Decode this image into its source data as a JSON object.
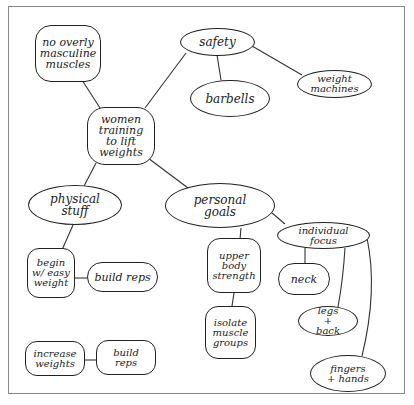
{
  "diagram": {
    "type": "mind-map",
    "style": "hand-drawn",
    "nodes": [
      {
        "id": "center",
        "label": "women training to lift weights"
      },
      {
        "id": "no-masc",
        "label": "no overly masculine muscles"
      },
      {
        "id": "safety",
        "label": "safety"
      },
      {
        "id": "barbells",
        "label": "barbells"
      },
      {
        "id": "weight-machines",
        "label": "weight machines"
      },
      {
        "id": "physical-stuff",
        "label": "physical stuff"
      },
      {
        "id": "begin-easy",
        "label": "begin w/ easy weight"
      },
      {
        "id": "build-reps-1",
        "label": "build reps"
      },
      {
        "id": "increase-weights",
        "label": "increase weights"
      },
      {
        "id": "build-reps-2",
        "label": "build reps"
      },
      {
        "id": "personal-goals",
        "label": "personal goals"
      },
      {
        "id": "upper-body",
        "label": "upper body strength"
      },
      {
        "id": "isolate",
        "label": "isolate muscle groups"
      },
      {
        "id": "individual-focus",
        "label": "individual focus"
      },
      {
        "id": "neck",
        "label": "neck"
      },
      {
        "id": "legs-back",
        "label": "legs + back"
      },
      {
        "id": "fingers-hands",
        "label": "fingers + hands"
      }
    ],
    "edges": [
      [
        "center",
        "no-masc"
      ],
      [
        "center",
        "safety"
      ],
      [
        "safety",
        "barbells"
      ],
      [
        "safety",
        "weight-machines"
      ],
      [
        "center",
        "physical-stuff"
      ],
      [
        "physical-stuff",
        "begin-easy"
      ],
      [
        "begin-easy",
        "build-reps-1"
      ],
      [
        "increase-weights",
        "build-reps-2"
      ],
      [
        "center",
        "personal-goals"
      ],
      [
        "personal-goals",
        "upper-body"
      ],
      [
        "upper-body",
        "isolate"
      ],
      [
        "personal-goals",
        "individual-focus"
      ],
      [
        "individual-focus",
        "neck"
      ],
      [
        "individual-focus",
        "legs-back"
      ],
      [
        "individual-focus",
        "fingers-hands"
      ]
    ]
  },
  "labels": {
    "center": "women training to lift weights",
    "no_masc": "no overly masculine muscles",
    "safety": "safety",
    "barbells": "barbells",
    "weight_machines": "weight machines",
    "physical_stuff": "physical stuff",
    "begin_easy": "begin w/ easy weight",
    "build_reps_1": "build reps",
    "increase_weights": "increase weights",
    "build_reps_2": "build reps",
    "personal_goals": "personal goals",
    "upper_body": "upper body strength",
    "isolate": "isolate muscle groups",
    "individual_focus": "individual focus",
    "neck": "neck",
    "legs_back": "legs + back",
    "fingers_hands": "fingers + hands"
  },
  "caption": ""
}
